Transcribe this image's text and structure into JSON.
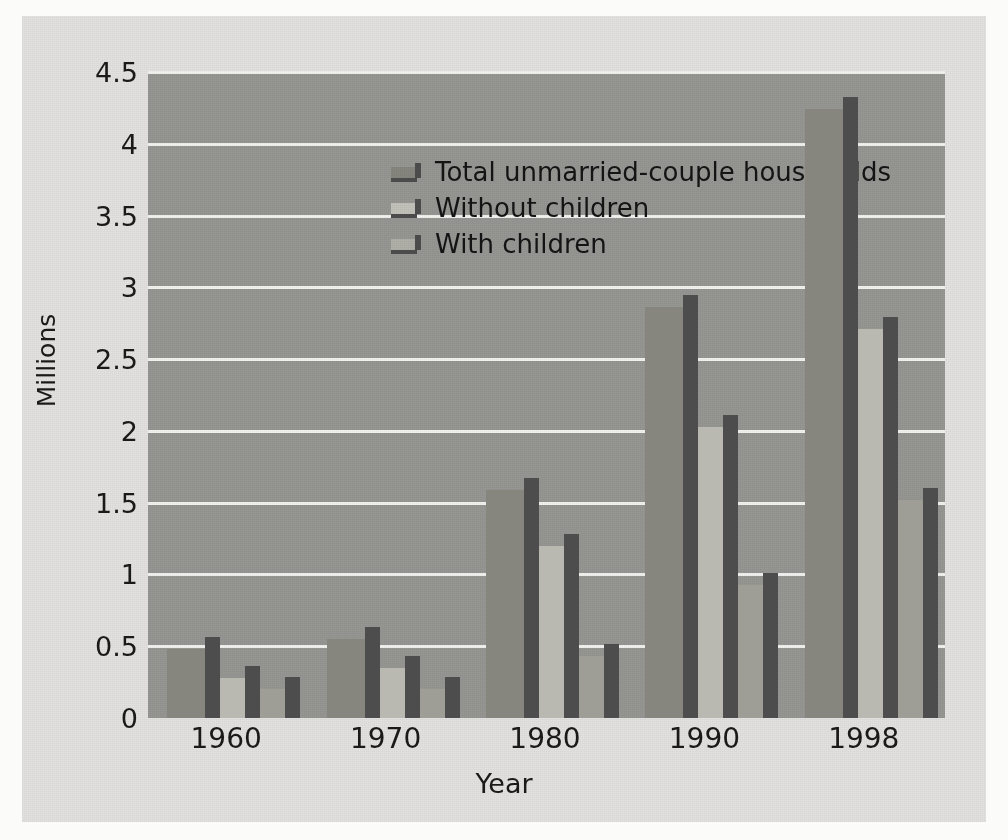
{
  "chart_data": {
    "type": "bar",
    "title": "",
    "xlabel": "Year",
    "ylabel": "Millions",
    "categories": [
      "1960",
      "1970",
      "1980",
      "1990",
      "1998"
    ],
    "series": [
      {
        "name": "Total unmarried-couple households",
        "values": [
          0.48,
          0.55,
          1.59,
          2.86,
          4.24
        ]
      },
      {
        "name": "Without children",
        "values": [
          0.28,
          0.35,
          1.2,
          2.03,
          2.71
        ]
      },
      {
        "name": "With children",
        "values": [
          0.2,
          0.2,
          0.43,
          0.93,
          1.52
        ]
      }
    ],
    "ylim": [
      0,
      4.5
    ],
    "ytick_values": [
      0,
      0.5,
      1,
      1.5,
      2,
      2.5,
      3,
      3.5,
      4,
      4.5
    ],
    "ytick_labels": [
      "0",
      "0.5",
      "1",
      "1.5",
      "2",
      "2.5",
      "3",
      "3.5",
      "4",
      "4.5"
    ],
    "grid": true,
    "legend_position": "upper-left-inside",
    "style": "3d-grayscale",
    "colors": {
      "plot_background": "#969693",
      "figure_background": "#e3e2e0",
      "gridline": "#f2f2f0",
      "series_total": "#86867f",
      "series_without": "#b9b9b2",
      "series_with": "#9e9e97",
      "bar_side_shadow": "#4d4d4d",
      "text": "#1a1a1a"
    }
  }
}
